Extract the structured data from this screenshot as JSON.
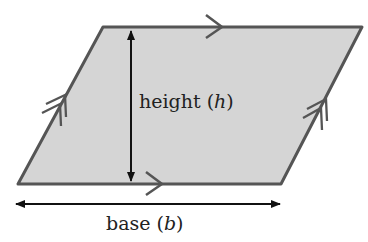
{
  "diagram": {
    "shape": "parallelogram",
    "labels": {
      "height": "height (",
      "height_var": "h",
      "height_close": ")",
      "base": "base (",
      "base_var": "b",
      "base_close": ")"
    },
    "colors": {
      "fill": "#d5d5d5",
      "stroke": "#555555",
      "arrow": "#111111"
    },
    "annotations": {
      "parallel_marks_horizontal": "single arrow",
      "parallel_marks_slanted": "double arrow"
    }
  }
}
